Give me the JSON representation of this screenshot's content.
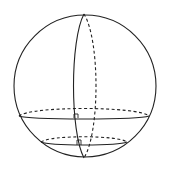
{
  "diagram": {
    "type": "sphere-with-cross-sections",
    "stroke_color": "#222222",
    "background": "#ffffff",
    "sphere": {
      "cx": 85,
      "cy": 86,
      "r": 71
    },
    "vertical_great_circle": {
      "top": [
        84,
        14
      ],
      "bottom": [
        84,
        158
      ],
      "front_rx": 11,
      "back_rx": 12
    },
    "large_section": {
      "cx": 84,
      "cy": 113,
      "rx": 65,
      "ry": 5,
      "right_angle_mark_at": [
        77,
        118
      ]
    },
    "small_section": {
      "cx": 84,
      "cy": 141,
      "rx": 44,
      "ry": 4,
      "right_angle_mark_at": [
        79,
        145
      ]
    }
  }
}
